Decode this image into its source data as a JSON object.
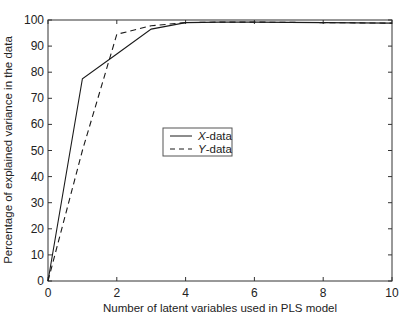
{
  "chart_data": {
    "type": "line",
    "title": "",
    "xlabel": "Number of latent variables used in PLS model",
    "ylabel": "Percentage of explained variance in the data",
    "xlim": [
      0,
      10
    ],
    "ylim": [
      0,
      100
    ],
    "xticks": [
      0,
      2,
      4,
      6,
      8,
      10
    ],
    "yticks": [
      0,
      10,
      20,
      30,
      40,
      50,
      60,
      70,
      80,
      90,
      100
    ],
    "grid": false,
    "legend_position": "center",
    "x": [
      0,
      1,
      2,
      3,
      4,
      5,
      6,
      7,
      8,
      9,
      10
    ],
    "series": [
      {
        "name": "X-data",
        "style": "solid",
        "values": [
          0,
          77.5,
          87,
          96.5,
          99,
          99.2,
          99.2,
          99.1,
          99,
          98.9,
          98.8
        ]
      },
      {
        "name": "Y-data",
        "style": "dashed",
        "values": [
          0,
          50,
          94.5,
          97.8,
          99,
          99.2,
          99.2,
          99.1,
          99,
          98.9,
          98.8
        ]
      }
    ]
  },
  "labels": {
    "xlabel": "Number of latent variables used in PLS model",
    "ylabel": "Percentage of explained variance in the data",
    "legend_x": "X",
    "legend_y": "Y",
    "legend_suffix": "-data"
  },
  "colors": {
    "line": "#1a1a1a",
    "axis": "#333333"
  }
}
